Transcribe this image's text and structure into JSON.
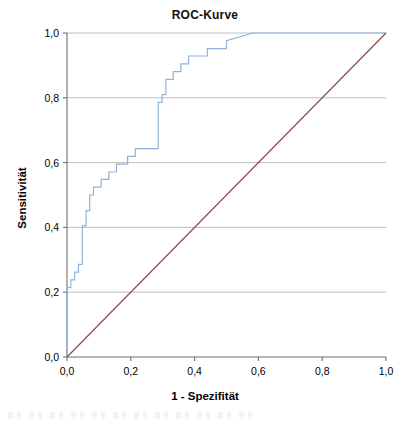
{
  "chart_data": {
    "type": "line",
    "title": "ROC-Kurve",
    "xlabel": "1 - Spezifität",
    "ylabel": "Sensitivität",
    "xlim": [
      0,
      1
    ],
    "ylim": [
      0,
      1
    ],
    "grid": true,
    "legend": "none",
    "xticks": [
      "0,0",
      "0,2",
      "0,4",
      "0,6",
      "0,8",
      "1,0"
    ],
    "xtick_values": [
      0.0,
      0.2,
      0.4,
      0.6,
      0.8,
      1.0
    ],
    "yticks": [
      "0,0",
      "0,2",
      "0,4",
      "0,6",
      "0,8",
      "1,0"
    ],
    "ytick_values": [
      0.0,
      0.2,
      0.4,
      0.6,
      0.8,
      1.0
    ],
    "colors": {
      "roc_curve": "#8fb4d9",
      "reference_line": "#8b4a52",
      "gridline": "#b9b9b9",
      "axis": "#6f6f6f"
    },
    "series": [
      {
        "name": "ROC-Kurve",
        "color": "#8fb4d9",
        "step": true,
        "x": [
          0.0,
          0.0,
          0.0,
          0.0,
          0.012,
          0.012,
          0.024,
          0.024,
          0.036,
          0.036,
          0.048,
          0.048,
          0.06,
          0.06,
          0.071,
          0.071,
          0.083,
          0.083,
          0.107,
          0.107,
          0.131,
          0.131,
          0.155,
          0.155,
          0.19,
          0.19,
          0.214,
          0.214,
          0.286,
          0.286,
          0.298,
          0.298,
          0.31,
          0.31,
          0.333,
          0.333,
          0.357,
          0.357,
          0.381,
          0.381,
          0.44,
          0.44,
          0.5,
          0.5,
          0.583,
          1.0
        ],
        "y": [
          0.0,
          0.167,
          0.19,
          0.214,
          0.214,
          0.238,
          0.238,
          0.262,
          0.262,
          0.286,
          0.286,
          0.405,
          0.405,
          0.452,
          0.452,
          0.5,
          0.5,
          0.524,
          0.524,
          0.548,
          0.548,
          0.571,
          0.571,
          0.595,
          0.595,
          0.619,
          0.619,
          0.643,
          0.643,
          0.786,
          0.786,
          0.81,
          0.81,
          0.857,
          0.857,
          0.881,
          0.881,
          0.905,
          0.905,
          0.929,
          0.929,
          0.952,
          0.952,
          0.976,
          1.0,
          1.0
        ]
      },
      {
        "name": "Referenzlinie",
        "color": "#8b4a52",
        "step": false,
        "x": [
          0.0,
          1.0
        ],
        "y": [
          0.0,
          1.0
        ]
      }
    ]
  },
  "caption": {
    "artifact_note": ""
  }
}
